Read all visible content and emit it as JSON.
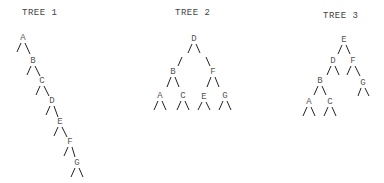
{
  "trees": [
    {
      "title": "TREE 1",
      "title_pos": [
        22,
        8
      ],
      "nodes": [
        {
          "label": "A",
          "x": 23,
          "y": 38
        },
        {
          "label": "B",
          "x": 33,
          "y": 61
        },
        {
          "label": "C",
          "x": 42,
          "y": 81
        },
        {
          "label": "D",
          "x": 52,
          "y": 101
        },
        {
          "label": "E",
          "x": 60,
          "y": 122
        },
        {
          "label": "F",
          "x": 70,
          "y": 142
        },
        {
          "label": "G",
          "x": 77,
          "y": 163
        }
      ]
    },
    {
      "title": "TREE 2",
      "title_pos": [
        175,
        8
      ],
      "nodes": [
        {
          "label": "D",
          "x": 194,
          "y": 39
        },
        {
          "label": "B",
          "x": 173,
          "y": 72
        },
        {
          "label": "F",
          "x": 213,
          "y": 72
        },
        {
          "label": "A",
          "x": 160,
          "y": 96
        },
        {
          "label": "C",
          "x": 183,
          "y": 96
        },
        {
          "label": "E",
          "x": 204,
          "y": 97
        },
        {
          "label": "G",
          "x": 225,
          "y": 96
        }
      ]
    },
    {
      "title": "TREE 3",
      "title_pos": [
        323,
        11
      ],
      "nodes": [
        {
          "label": "E",
          "x": 344,
          "y": 40
        },
        {
          "label": "D",
          "x": 333,
          "y": 61
        },
        {
          "label": "F",
          "x": 353,
          "y": 61
        },
        {
          "label": "B",
          "x": 320,
          "y": 81
        },
        {
          "label": "G",
          "x": 363,
          "y": 83
        },
        {
          "label": "A",
          "x": 309,
          "y": 102
        },
        {
          "label": "C",
          "x": 330,
          "y": 102
        }
      ]
    }
  ]
}
